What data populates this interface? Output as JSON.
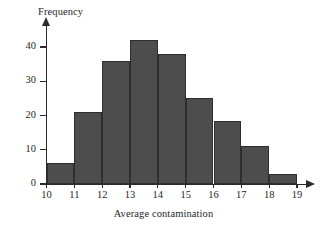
{
  "chart_data": {
    "type": "bar",
    "title": "",
    "xlabel": "Average contamination",
    "ylabel": "Frequency",
    "categories": [
      "10-11",
      "11-12",
      "12-13",
      "13-14",
      "14-15",
      "15-16",
      "16-17",
      "17-18",
      "18-19"
    ],
    "bin_edges": [
      10,
      11,
      12,
      13,
      14,
      15,
      16,
      17,
      18,
      19
    ],
    "values": [
      6,
      21,
      36,
      42,
      38,
      25,
      18.5,
      11,
      3
    ],
    "xlim": [
      10,
      19
    ],
    "ylim": [
      0,
      44
    ],
    "xticks": [
      "10",
      "11",
      "12",
      "13",
      "14",
      "15",
      "16",
      "17",
      "18",
      "19"
    ],
    "yticks": [
      "0",
      "10",
      "20",
      "30",
      "40"
    ],
    "ytick_values": [
      0,
      10,
      20,
      30,
      40
    ],
    "grid": false,
    "legend": null,
    "bar_color": "#4d4d4d",
    "bar_edge_color": "#2e2e2e",
    "axis_color": "#2a2a2a",
    "background": "#ffffff"
  }
}
